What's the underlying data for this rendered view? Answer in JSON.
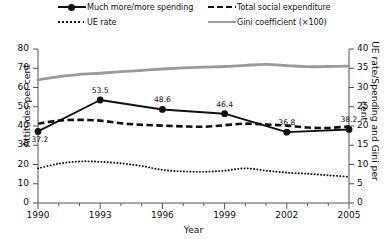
{
  "chart_data": {
    "type": "line",
    "title": "",
    "xlabel": "Year",
    "ylabel": "Attitudes per cent",
    "ylabel_right": "UE rate/Spending and Gini per cent",
    "xlim": [
      1990,
      2005
    ],
    "ylim": [
      0,
      80
    ],
    "ylim_right": [
      0,
      40
    ],
    "grid": false,
    "legend_position": "top",
    "xticks": [
      "1990",
      "1993",
      "1996",
      "1999",
      "2002",
      "2005"
    ],
    "xtick_values": [
      1990,
      1993,
      1996,
      1999,
      2002,
      2005
    ],
    "yticks_left": [
      "0",
      "10",
      "20",
      "30",
      "40",
      "50",
      "60",
      "70",
      "80"
    ],
    "ytick_values_left": [
      0,
      10,
      20,
      30,
      40,
      50,
      60,
      70,
      80
    ],
    "yticks_right": [
      "0",
      "5",
      "10",
      "15",
      "20",
      "25",
      "30",
      "35",
      "40"
    ],
    "ytick_values_right": [
      0,
      5,
      10,
      15,
      20,
      25,
      30,
      35,
      40
    ],
    "series": [
      {
        "name": "Much more/more spending",
        "axis": "left",
        "style": "solid-marker",
        "color": "#111111",
        "x": [
          1990,
          1993,
          1996,
          1999,
          2002,
          2005
        ],
        "values": [
          37.2,
          53.5,
          48.6,
          46.4,
          36.8,
          38.2
        ],
        "point_labels": [
          "37.2",
          "53.5",
          "48.6",
          "46.4",
          "36.8",
          "38.2"
        ]
      },
      {
        "name": "Total social expenditure",
        "axis": "right",
        "style": "dashed",
        "color": "#111111",
        "x": [
          1990,
          1991,
          1992,
          1993,
          1994,
          1995,
          1996,
          1997,
          1998,
          1999,
          2000,
          2001,
          2002,
          2003,
          2004,
          2005
        ],
        "values": [
          20.6,
          21.4,
          21.6,
          21.4,
          20.7,
          20.3,
          20.1,
          19.9,
          19.8,
          20.2,
          20.6,
          20.4,
          20.1,
          19.6,
          19.5,
          19.9
        ]
      },
      {
        "name": "UE rate",
        "axis": "right",
        "style": "dotted",
        "color": "#111111",
        "x": [
          1990,
          1991,
          1992,
          1993,
          1994,
          1995,
          1996,
          1997,
          1998,
          1999,
          2000,
          2001,
          2002,
          2003,
          2004,
          2005
        ],
        "values": [
          9.0,
          10.2,
          10.8,
          10.7,
          10.3,
          9.6,
          8.6,
          8.2,
          8.1,
          8.4,
          9.0,
          8.4,
          7.9,
          7.6,
          7.2,
          6.8
        ]
      },
      {
        "name": "Gini coefficient (×100)",
        "axis": "left",
        "style": "thick-gray",
        "color": "#9a9a9a",
        "x": [
          1990,
          1991,
          1992,
          1993,
          1994,
          1995,
          1996,
          1997,
          1998,
          1999,
          2000,
          2001,
          2002,
          2003,
          2004,
          2005
        ],
        "values": [
          64.0,
          65.6,
          66.8,
          67.4,
          68.2,
          68.9,
          69.6,
          70.2,
          70.6,
          70.9,
          71.5,
          72.0,
          71.4,
          70.8,
          70.9,
          71.1
        ]
      }
    ]
  },
  "legend": {
    "items": [
      {
        "label": "Much more/more spending"
      },
      {
        "label": "Total social expenditure"
      },
      {
        "label": "UE rate"
      },
      {
        "label": "Gini coefficient (×100)"
      }
    ]
  },
  "axes": {
    "x_title": "Year",
    "y_left_title": "Attitudes per cent",
    "y_right_title": "UE rate/Spending and Gini per cent"
  }
}
